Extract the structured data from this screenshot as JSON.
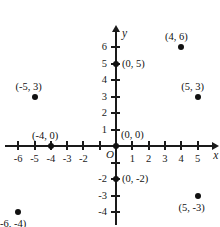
{
  "chart_data": {
    "type": "scatter",
    "title": "",
    "xlabel": "x",
    "ylabel": "y",
    "xlim": [
      -6.8,
      5.9
    ],
    "ylim": [
      -4.8,
      7.0
    ],
    "grid": false,
    "legend": null,
    "origin_label": "O",
    "x_tick_labels": [
      "-6",
      "-5",
      "-4",
      "-3",
      "-2",
      "1",
      "2",
      "3",
      "4",
      "5"
    ],
    "x_tick_values": [
      -6,
      -5,
      -4,
      -3,
      -2,
      1,
      2,
      3,
      4,
      5
    ],
    "y_tick_labels": [
      "6",
      "5",
      "4",
      "3",
      "2",
      "1",
      "-2",
      "-3",
      "-4"
    ],
    "y_tick_values": [
      6,
      5,
      4,
      3,
      2,
      1,
      -2,
      -3,
      -4
    ],
    "x_ticks_drawn": [
      -6,
      -5,
      -4,
      -3,
      -2,
      -1,
      1,
      2,
      3,
      4,
      5
    ],
    "y_ticks_drawn": [
      6,
      5,
      4,
      3,
      2,
      1,
      -1,
      -2,
      -3,
      -4
    ],
    "points": [
      {
        "label": "(4, 6)",
        "x": 4,
        "y": 6,
        "label_pos": "above"
      },
      {
        "label": "(0, 5)",
        "x": 0,
        "y": 5,
        "label_pos": "right"
      },
      {
        "label": "(5, 3)",
        "x": 5,
        "y": 3,
        "label_pos": "above"
      },
      {
        "label": "(-5, 3)",
        "x": -5,
        "y": 3,
        "label_pos": "above"
      },
      {
        "label": "(-4, 0)",
        "x": -4,
        "y": 0,
        "label_pos": "above"
      },
      {
        "label": "(0, 0)",
        "x": 0,
        "y": 0,
        "label_pos": "upper-right"
      },
      {
        "label": "(0, -2)",
        "x": 0,
        "y": -2,
        "label_pos": "right"
      },
      {
        "label": "(5, -3)",
        "x": 5,
        "y": -3,
        "label_pos": "below"
      },
      {
        "label": "(-6, -4)",
        "x": -6,
        "y": -4,
        "label_pos": "below"
      }
    ],
    "colors": {
      "axis": "#1a1a1a",
      "point": "#111111",
      "label": "#111111",
      "background": "#ffffff"
    }
  }
}
